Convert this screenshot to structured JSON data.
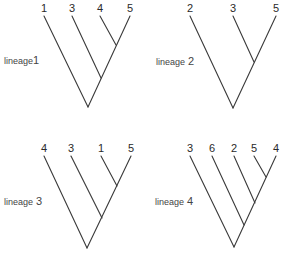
{
  "colors": {
    "line": "#3a3a3a",
    "text": "#2a2a2a",
    "background": "#ffffff"
  },
  "lineages": [
    {
      "name": "lineage",
      "number": "1",
      "label_pos": [
        4,
        56
      ],
      "tips": [
        {
          "label": "1",
          "x": 44,
          "y": 16
        },
        {
          "label": "3",
          "x": 72,
          "y": 16
        },
        {
          "label": "4",
          "x": 100,
          "y": 16
        },
        {
          "label": "5",
          "x": 130,
          "y": 16
        }
      ],
      "root": [
        88,
        107
      ],
      "nodes": [
        [
          101,
          78
        ],
        [
          116,
          45
        ]
      ],
      "edges": [
        [
          [
            88,
            107
          ],
          [
            44,
            16
          ]
        ],
        [
          [
            88,
            107
          ],
          [
            130,
            16
          ]
        ],
        [
          [
            101,
            78
          ],
          [
            72,
            16
          ]
        ],
        [
          [
            116,
            45
          ],
          [
            100,
            16
          ]
        ]
      ]
    },
    {
      "name": "lineage",
      "number": "2",
      "label_pos": [
        156,
        57
      ],
      "tips": [
        {
          "label": "2",
          "x": 190,
          "y": 16
        },
        {
          "label": "3",
          "x": 233,
          "y": 16
        },
        {
          "label": "5",
          "x": 276,
          "y": 16
        }
      ],
      "root": [
        233,
        108
      ],
      "nodes": [
        [
          254,
          62
        ]
      ],
      "edges": [
        [
          [
            233,
            108
          ],
          [
            190,
            16
          ]
        ],
        [
          [
            233,
            108
          ],
          [
            276,
            16
          ]
        ],
        [
          [
            254,
            62
          ],
          [
            233,
            16
          ]
        ]
      ]
    },
    {
      "name": "lineage",
      "number": "3",
      "label_pos": [
        4,
        197
      ],
      "tips": [
        {
          "label": "4",
          "x": 44,
          "y": 156
        },
        {
          "label": "3",
          "x": 71,
          "y": 156
        },
        {
          "label": "1",
          "x": 101,
          "y": 156
        },
        {
          "label": "5",
          "x": 131,
          "y": 156
        }
      ],
      "root": [
        87,
        248
      ],
      "nodes": [
        [
          102,
          218
        ],
        [
          117,
          186
        ]
      ],
      "edges": [
        [
          [
            87,
            248
          ],
          [
            44,
            156
          ]
        ],
        [
          [
            87,
            248
          ],
          [
            131,
            156
          ]
        ],
        [
          [
            102,
            218
          ],
          [
            71,
            156
          ]
        ],
        [
          [
            117,
            186
          ],
          [
            101,
            156
          ]
        ]
      ]
    },
    {
      "name": "lineage",
      "number": "4",
      "label_pos": [
        155,
        197
      ],
      "tips": [
        {
          "label": "3",
          "x": 190,
          "y": 156
        },
        {
          "label": "6",
          "x": 212,
          "y": 156
        },
        {
          "label": "2",
          "x": 234,
          "y": 156
        },
        {
          "label": "5",
          "x": 254,
          "y": 156
        },
        {
          "label": "4",
          "x": 276,
          "y": 156
        }
      ],
      "root": [
        234,
        247
      ],
      "nodes": [
        [
          244,
          225
        ],
        [
          255,
          203
        ],
        [
          266,
          177
        ]
      ],
      "edges": [
        [
          [
            234,
            247
          ],
          [
            190,
            156
          ]
        ],
        [
          [
            234,
            247
          ],
          [
            276,
            156
          ]
        ],
        [
          [
            244,
            225
          ],
          [
            212,
            156
          ]
        ],
        [
          [
            255,
            203
          ],
          [
            234,
            156
          ]
        ],
        [
          [
            266,
            177
          ],
          [
            254,
            156
          ]
        ]
      ]
    }
  ]
}
